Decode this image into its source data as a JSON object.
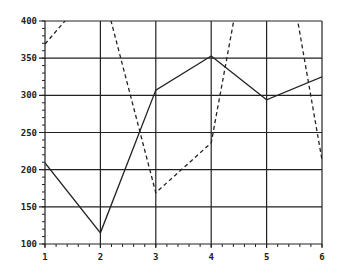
{
  "chart_data": {
    "type": "line",
    "title": "",
    "xlabel": "",
    "ylabel": "",
    "x": [
      1,
      2,
      3,
      4,
      5,
      6
    ],
    "xlim": [
      1,
      6
    ],
    "ylim": [
      100,
      400
    ],
    "x_ticks": [
      "1",
      "2",
      "3",
      "4",
      "5",
      "6"
    ],
    "y_ticks": [
      "100",
      "150",
      "200",
      "250",
      "300",
      "350",
      "400"
    ],
    "grid": true,
    "legend": null,
    "series": [
      {
        "name": "solid",
        "style": "solid",
        "values": [
          209,
          115,
          307,
          353,
          294,
          325
        ]
      },
      {
        "name": "dashed",
        "style": "dashed",
        "values": [
          369,
          455,
          169,
          236,
          640,
          213
        ]
      }
    ]
  },
  "colors": {
    "line": "#222222",
    "grid": "#222222",
    "background": "#ffffff"
  }
}
